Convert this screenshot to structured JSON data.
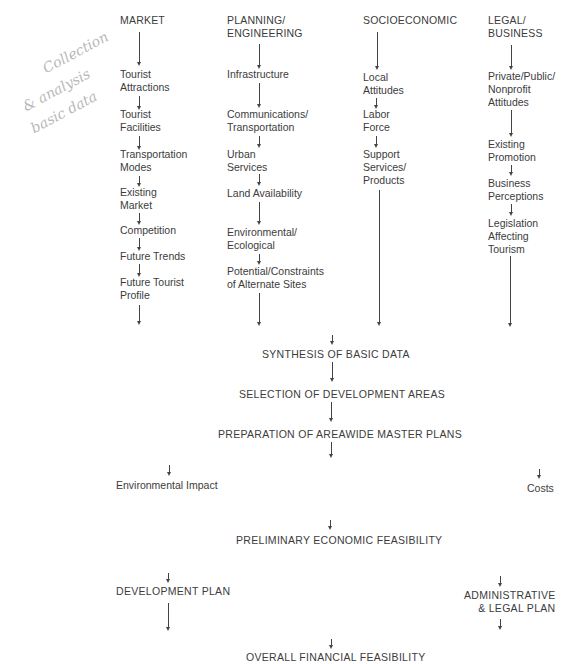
{
  "handwritten_note": [
    "Collection",
    "& analysis",
    "basic data"
  ],
  "columns": {
    "market": {
      "header": "MARKET",
      "items": [
        "Tourist\nAttractions",
        "Tourist\nFacilities",
        "Transportation\nModes",
        "Existing\nMarket",
        "Competition",
        "Future Trends",
        "Future Tourist\nProfile"
      ]
    },
    "planning": {
      "header": "PLANNING/\nENGINEERING",
      "items": [
        "Infrastructure",
        "Communications/\nTransportation",
        "Urban\nServices",
        "Land Availability",
        "Environmental/\nEcological",
        "Potential/Constraints\nof Alternate Sites"
      ]
    },
    "socioeconomic": {
      "header": "SOCIOECONOMIC",
      "items": [
        "Local\nAttitudes",
        "Labor\nForce",
        "Support\nServices/\nProducts"
      ]
    },
    "legal": {
      "header": "LEGAL/\nBUSINESS",
      "items": [
        "Private/Public/\nNonprofit\nAttitudes",
        "Existing\nPromotion",
        "Business\nPerceptions",
        "Legislation\nAffecting\nTourism"
      ]
    }
  },
  "stages": {
    "synthesis": "SYNTHESIS OF BASIC DATA",
    "selection": "SELECTION OF DEVELOPMENT AREAS",
    "preparation": "PREPARATION OF AREAWIDE MASTER PLANS",
    "environmental_impact": "Environmental Impact",
    "costs": "Costs",
    "preliminary": "PRELIMINARY ECONOMIC FEASIBILITY",
    "development_plan": "DEVELOPMENT PLAN",
    "admin_legal_plan": "ADMINISTRATIVE\n& LEGAL PLAN",
    "overall": "OVERALL FINANCIAL FEASIBILITY"
  }
}
